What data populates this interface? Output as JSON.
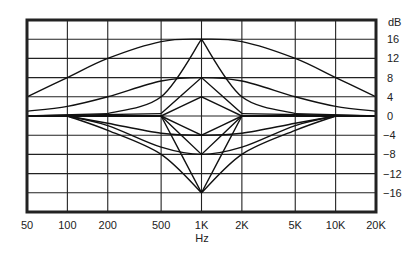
{
  "chart_data": {
    "type": "line",
    "title": "",
    "xlabel": "Hz",
    "ylabel": "dB",
    "xscale": "log",
    "xlim": [
      50,
      20000
    ],
    "ylim": [
      -20,
      20
    ],
    "grid": true,
    "x_ticks": [
      {
        "value": 50,
        "label": "50"
      },
      {
        "value": 100,
        "label": "100"
      },
      {
        "value": 200,
        "label": "200"
      },
      {
        "value": 500,
        "label": "500"
      },
      {
        "value": 1000,
        "label": "1K"
      },
      {
        "value": 2000,
        "label": "2K"
      },
      {
        "value": 5000,
        "label": "5K"
      },
      {
        "value": 10000,
        "label": "10K"
      },
      {
        "value": 20000,
        "label": "20K"
      }
    ],
    "y_ticks": [
      {
        "value": 16,
        "label": "16"
      },
      {
        "value": 12,
        "label": "12"
      },
      {
        "value": 8,
        "label": "8"
      },
      {
        "value": 4,
        "label": "4"
      },
      {
        "value": 0,
        "label": "0"
      },
      {
        "value": -4,
        "label": "−4"
      },
      {
        "value": -8,
        "label": "−8"
      },
      {
        "value": -12,
        "label": "−12"
      },
      {
        "value": -16,
        "label": "−16"
      }
    ],
    "center_frequency": 1000,
    "series": [
      {
        "name": "boost +16 dB wide",
        "gain": 16,
        "x": [
          50,
          100,
          200,
          500,
          1000,
          2000,
          5000,
          10000,
          20000
        ],
        "values": [
          4,
          8,
          12,
          15.5,
          16,
          15.5,
          12,
          8,
          4
        ]
      },
      {
        "name": "boost +8 dB wide",
        "gain": 8,
        "x": [
          50,
          100,
          200,
          500,
          1000,
          2000,
          5000,
          10000,
          20000
        ],
        "values": [
          1,
          2,
          4,
          7.3,
          8,
          7.3,
          4,
          2,
          1
        ]
      },
      {
        "name": "boost +16 dB narrow",
        "gain": 16,
        "x": [
          200,
          500,
          1000,
          2000,
          5000
        ],
        "values": [
          0.5,
          4,
          16,
          4,
          0.5
        ]
      },
      {
        "name": "boost +8 dB narrow",
        "gain": 8,
        "x": [
          500,
          1000,
          2000
        ],
        "values": [
          0.5,
          8,
          0.5
        ]
      },
      {
        "name": "boost +4 dB narrow",
        "gain": 4,
        "x": [
          500,
          1000,
          2000
        ],
        "values": [
          0,
          4,
          0
        ]
      },
      {
        "name": "cut -4 dB wide",
        "gain": -4,
        "x": [
          100,
          200,
          500,
          1000,
          2000,
          5000,
          10000
        ],
        "values": [
          0,
          -1.5,
          -3.6,
          -4,
          -3.6,
          -1.5,
          0
        ]
      },
      {
        "name": "cut -8 dB wide",
        "gain": -8,
        "x": [
          100,
          200,
          500,
          1000,
          2000,
          5000,
          10000
        ],
        "values": [
          0,
          -2,
          -6.5,
          -8,
          -6.5,
          -2,
          0
        ]
      },
      {
        "name": "cut -16 dB wide",
        "gain": -16,
        "x": [
          100,
          200,
          500,
          1000,
          2000,
          5000,
          10000
        ],
        "values": [
          0,
          -3,
          -8,
          -16,
          -8,
          -3,
          0
        ]
      },
      {
        "name": "cut -4 dB narrow",
        "gain": -4,
        "x": [
          500,
          1000,
          2000
        ],
        "values": [
          0,
          -4,
          0
        ]
      },
      {
        "name": "cut -8 dB narrow",
        "gain": -8,
        "x": [
          500,
          1000,
          2000
        ],
        "values": [
          0,
          -8,
          0
        ]
      },
      {
        "name": "cut -16 dB narrow",
        "gain": -16,
        "x": [
          500,
          1000,
          2000
        ],
        "values": [
          0,
          -16,
          0
        ]
      }
    ]
  },
  "labels": {
    "x_unit": "Hz",
    "y_unit": "dB"
  }
}
